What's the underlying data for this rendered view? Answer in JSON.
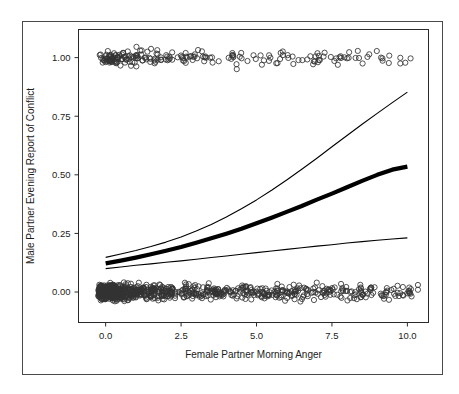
{
  "figure": {
    "outer_border_color": "#4a4a4a",
    "plot_border_color": "#2a2a2a",
    "background_color": "#ffffff"
  },
  "chart_data": {
    "type": "scatter",
    "title": "",
    "subtitle": "",
    "xlabel": "Female Partner Morning Anger",
    "ylabel": "Male Partner Evening Report of Conflict",
    "xlim": [
      -0.9,
      10.7
    ],
    "ylim": [
      -0.13,
      1.12
    ],
    "xticks": [
      0.0,
      2.5,
      5.0,
      7.5,
      10.0
    ],
    "xticklabels": [
      "0.0",
      "2.5",
      "5.0",
      "7.5",
      "10.0"
    ],
    "yticks": [
      0.0,
      0.25,
      0.5,
      0.75,
      1.0
    ],
    "yticklabels": [
      "0.00",
      "0.25",
      "0.50",
      "0.75",
      "1.00"
    ],
    "grid": false,
    "legend": null,
    "marker": {
      "shape": "open-circle",
      "radius": 2.6,
      "edge_color": "#333333",
      "fill": "none"
    },
    "series": [
      {
        "name": "Fitted probability",
        "type": "line",
        "style": "thick-solid",
        "linewidth": 4.2,
        "color": "#000000",
        "x": [
          0.0,
          0.5,
          1.0,
          1.5,
          2.0,
          2.5,
          3.0,
          3.5,
          4.0,
          4.5,
          5.0,
          5.5,
          6.0,
          6.5,
          7.0,
          7.5,
          8.0,
          8.5,
          9.0,
          9.5,
          10.0
        ],
        "y": [
          0.122,
          0.134,
          0.147,
          0.161,
          0.176,
          0.192,
          0.21,
          0.229,
          0.249,
          0.27,
          0.293,
          0.317,
          0.342,
          0.367,
          0.394,
          0.42,
          0.447,
          0.474,
          0.5,
          0.522,
          0.535
        ]
      },
      {
        "name": "Upper 95% confidence limit",
        "type": "line",
        "style": "thin-solid",
        "linewidth": 1.1,
        "color": "#000000",
        "x": [
          0.0,
          0.5,
          1.0,
          1.5,
          2.0,
          2.5,
          3.0,
          3.5,
          4.0,
          4.5,
          5.0,
          5.5,
          6.0,
          6.5,
          7.0,
          7.5,
          8.0,
          8.5,
          9.0,
          9.5,
          10.0
        ],
        "y": [
          0.148,
          0.162,
          0.177,
          0.194,
          0.213,
          0.235,
          0.26,
          0.288,
          0.32,
          0.355,
          0.393,
          0.434,
          0.478,
          0.524,
          0.571,
          0.62,
          0.668,
          0.716,
          0.762,
          0.808,
          0.853
        ]
      },
      {
        "name": "Lower 95% confidence limit",
        "type": "line",
        "style": "thin-solid",
        "linewidth": 1.1,
        "color": "#000000",
        "x": [
          0.0,
          0.5,
          1.0,
          1.5,
          2.0,
          2.5,
          3.0,
          3.5,
          4.0,
          4.5,
          5.0,
          5.5,
          6.0,
          6.5,
          7.0,
          7.5,
          8.0,
          8.5,
          9.0,
          9.5,
          10.0
        ],
        "y": [
          0.1,
          0.107,
          0.114,
          0.12,
          0.127,
          0.133,
          0.14,
          0.147,
          0.154,
          0.161,
          0.168,
          0.175,
          0.182,
          0.189,
          0.196,
          0.202,
          0.209,
          0.215,
          0.221,
          0.226,
          0.231
        ]
      },
      {
        "name": "Observed conflict = 1 (jittered)",
        "type": "scatter",
        "note": "dense cluster near x 0-2.5, sparse out to x=10.2, y jittered about 1.0"
      },
      {
        "name": "Observed conflict = 0 (jittered)",
        "type": "scatter",
        "note": "very dense cluster near x 0-1, thinning out to x=10.2, y jittered about 0.0"
      }
    ]
  }
}
